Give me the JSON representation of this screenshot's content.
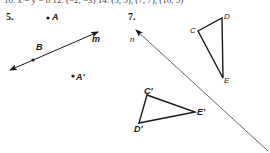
{
  "header": {
    "cutoff_text": "10. x  =  y  −  8    12. (−2, −3)    14. (5, 5), (7, 7), (10, 5)"
  },
  "problems": [
    {
      "number": "5.",
      "points": {
        "A": "A",
        "A_prime": "A'",
        "B": "B"
      },
      "line_label": "m"
    },
    {
      "number": "7.",
      "line_label": "n",
      "triangle": {
        "C": "C",
        "D": "D",
        "E": "E"
      },
      "triangle_image": {
        "C": "C'",
        "D": "D'",
        "E": "E'"
      }
    }
  ],
  "colors": {
    "ink": "#1a1a1a",
    "line_n": "#555555"
  }
}
